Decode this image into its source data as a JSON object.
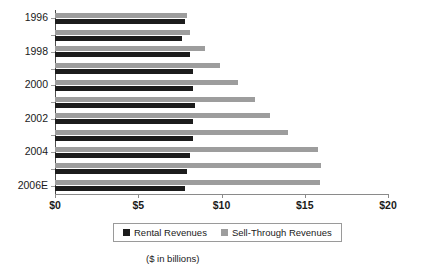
{
  "chart_data": {
    "type": "bar",
    "orientation": "horizontal",
    "title": "",
    "subtitle": "",
    "xlabel": "",
    "ylabel": "",
    "caption": "($ in billions)",
    "xlim": [
      0,
      20
    ],
    "xticks": [
      0,
      5,
      10,
      15,
      20
    ],
    "xtick_labels": [
      "$0",
      "$5",
      "$10",
      "$15",
      "$20"
    ],
    "grid": false,
    "legend_position": "bottom",
    "categories": [
      "1996",
      "1997",
      "1998",
      "1999",
      "2000",
      "2001",
      "2002",
      "2003",
      "2004",
      "2005",
      "2006E"
    ],
    "category_tick_labels": [
      "1996",
      "",
      "1998",
      "",
      "2000",
      "",
      "2002",
      "",
      "2004",
      "",
      "2006E"
    ],
    "series": [
      {
        "name": "Rental Revenues",
        "color": "#1c1c1c",
        "values": [
          7.8,
          7.6,
          8.1,
          8.3,
          8.3,
          8.4,
          8.3,
          8.3,
          8.1,
          7.9,
          7.8
        ]
      },
      {
        "name": "Sell-Through Revenues",
        "color": "#9d9d9d",
        "values": [
          7.9,
          8.1,
          9.0,
          9.9,
          11.0,
          12.0,
          12.9,
          14.0,
          15.8,
          16.0,
          15.9
        ]
      }
    ]
  },
  "legend": {
    "entries": [
      {
        "label": "Rental Revenues",
        "swatch": "rental-swatch"
      },
      {
        "label": "Sell-Through Revenues",
        "swatch": "sell-through-swatch"
      }
    ]
  }
}
